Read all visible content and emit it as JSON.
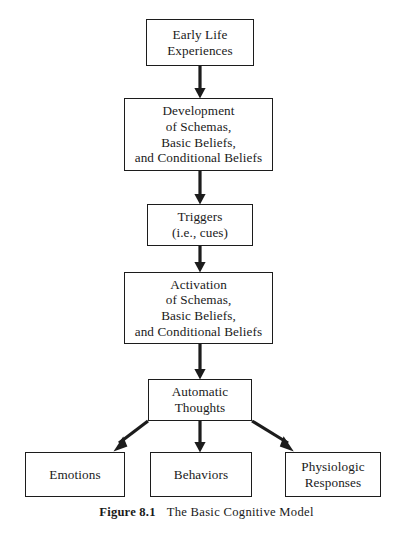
{
  "figure": {
    "caption_number": "Figure 8.1",
    "caption_title": "The Basic Cognitive Model",
    "line_color": "#1c1c1c",
    "background": "#ffffff"
  },
  "diagram": {
    "type": "flowchart",
    "nodes": [
      {
        "id": "early-life",
        "label": "Early Life\nExperiences"
      },
      {
        "id": "development",
        "label": "Development\nof Schemas,\nBasic Beliefs,\nand Conditional Beliefs"
      },
      {
        "id": "triggers",
        "label": "Triggers\n(i.e., cues)"
      },
      {
        "id": "activation",
        "label": "Activation\nof Schemas,\nBasic Beliefs,\nand Conditional Beliefs"
      },
      {
        "id": "automatic",
        "label": "Automatic\nThoughts"
      },
      {
        "id": "emotions",
        "label": "Emotions"
      },
      {
        "id": "behaviors",
        "label": "Behaviors"
      },
      {
        "id": "physiologic",
        "label": "Physiologic\nResponses"
      }
    ],
    "edges": [
      {
        "from": "early-life",
        "to": "development",
        "style": "straight-down"
      },
      {
        "from": "development",
        "to": "triggers",
        "style": "straight-down"
      },
      {
        "from": "triggers",
        "to": "activation",
        "style": "straight-down"
      },
      {
        "from": "activation",
        "to": "automatic",
        "style": "straight-down"
      },
      {
        "from": "automatic",
        "to": "emotions",
        "style": "diagonal-left"
      },
      {
        "from": "automatic",
        "to": "behaviors",
        "style": "straight-down"
      },
      {
        "from": "automatic",
        "to": "physiologic",
        "style": "diagonal-right"
      }
    ]
  }
}
